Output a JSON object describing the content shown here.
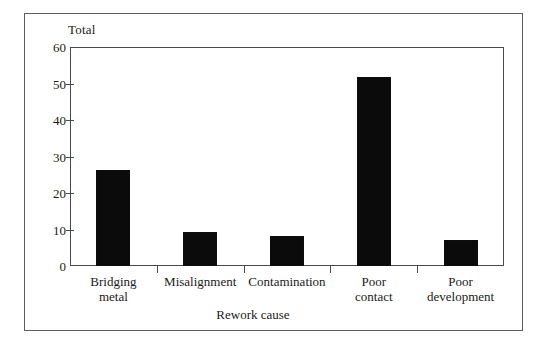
{
  "chart_data": {
    "type": "bar",
    "title": "",
    "subtitle": "",
    "xlabel": "Rework cause",
    "ylabel": "Total",
    "categories": [
      "Bridging metal",
      "Misalignment",
      "Contamination",
      "Poor contact",
      "Poor development"
    ],
    "category_lines": [
      [
        "Bridging",
        "metal"
      ],
      [
        "Misalignment"
      ],
      [
        "Contamination"
      ],
      [
        "Poor",
        "contact"
      ],
      [
        "Poor",
        "development"
      ]
    ],
    "values": [
      26.5,
      9.5,
      8.5,
      52,
      7.5
    ],
    "ylim": [
      0,
      60
    ],
    "yticks": [
      0,
      10,
      20,
      30,
      40,
      50,
      60
    ],
    "ytick_labels": [
      "0",
      "10",
      "20",
      "30",
      "40",
      "50",
      "60"
    ],
    "grid": false,
    "legend": "none",
    "bar_color": "#0b0b0b",
    "axis_color": "#4a4a4a",
    "frame_color": "#5d5d5d",
    "background": "#ffffff"
  },
  "figure": {
    "y_axis_title": "Total",
    "x_axis_title": "Rework cause"
  }
}
